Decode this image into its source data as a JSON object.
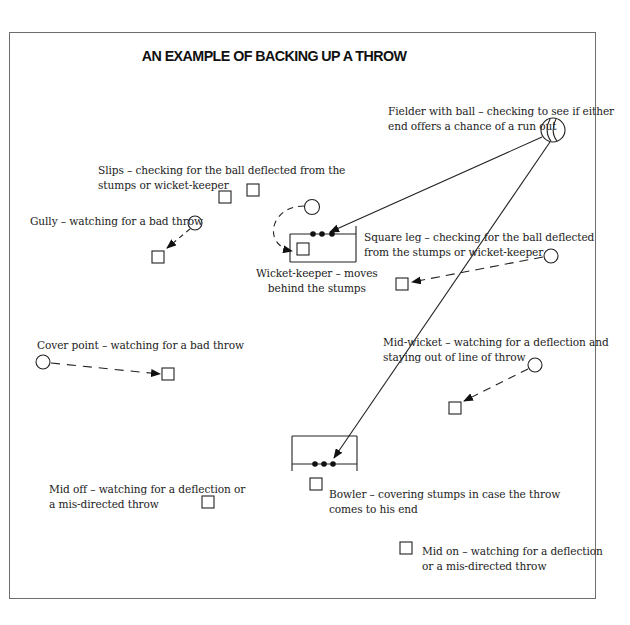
{
  "title": "AN EXAMPLE OF BACKING UP A THROW",
  "labels": {
    "fielder_with_ball": [
      "Fielder with ball – checking to see if either",
      "end offers a chance of a run out"
    ],
    "slips": [
      "Slips – checking for the ball deflected from the",
      "stumps or wicket-keeper"
    ],
    "gully": [
      "Gully – watching for a bad throw"
    ],
    "wicket_keeper": [
      "Wicket-keeper – moves",
      "behind the stumps"
    ],
    "square_leg": [
      "Square leg – checking for the ball deflected",
      "from the stumps or wicket-keeper"
    ],
    "cover_point": [
      "Cover point – watching for a bad throw"
    ],
    "mid_wicket": [
      "Mid-wicket – watching for a deflection and",
      "staying out of line of throw"
    ],
    "bowler": [
      "Bowler – covering stumps in case the throw",
      "comes to his end"
    ],
    "mid_off": [
      "Mid off – watching for a deflection or",
      "a mis-directed throw"
    ],
    "mid_on": [
      "Mid on – watching for a deflection",
      "or a mis-directed throw"
    ]
  },
  "legend_semantics": {
    "circle": "fielder starting position",
    "square": "fielder backing-up position",
    "dashed_arrow": "fielder movement",
    "solid_arrow": "throw line",
    "ball_icon": "fielder with ball"
  },
  "colors": {
    "ink": "#222222",
    "frame": "#6e6e6e",
    "background": "#ffffff"
  }
}
